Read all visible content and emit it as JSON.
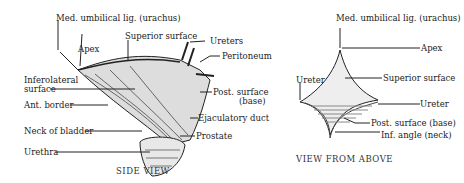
{
  "side_view": {
    "caption": "SIDE VIEW",
    "labels": {
      "urachus": "Med. umbilical lig. (urachus)",
      "superior_surface": "Superior surface",
      "apex": "Apex",
      "ureters": "Ureters",
      "peritoneum": "Peritoneum",
      "inferolateral_1": "Inferolateral",
      "inferolateral_2": "surface",
      "post_surface_1": "Post. surface",
      "post_surface_2": "(base)",
      "ant_border": "Ant. border",
      "ejaculatory_duct": "Ejaculatory duct",
      "neck_of_bladder": "Neck of bladder",
      "prostate": "Prostate",
      "urethra": "Urethra"
    }
  },
  "above_view": {
    "caption": "VIEW FROM ABOVE",
    "labels": {
      "urachus": "Med. umbilical lig. (urachus)",
      "apex": "Apex",
      "superior_surface": "Superior surface",
      "ureter_left": "Ureter",
      "ureter_right": "Ureter",
      "post_surface": "Post. surface (base)",
      "inf_angle": "Inf. angle (neck)"
    }
  }
}
